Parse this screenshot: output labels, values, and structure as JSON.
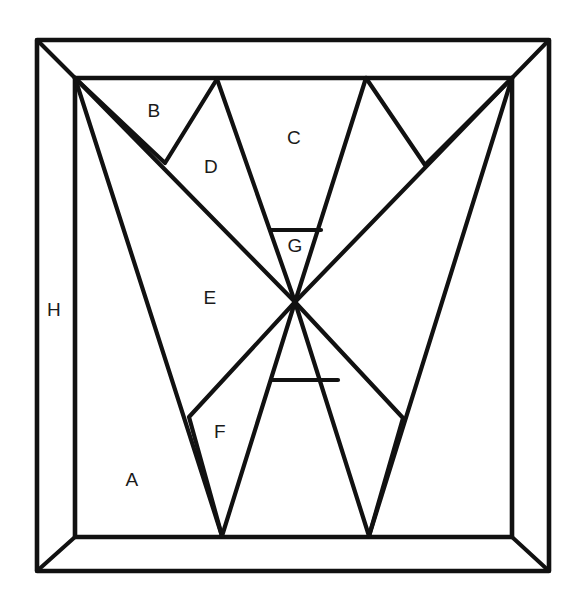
{
  "figure": {
    "name": "quilt-block-geometry-diagram",
    "type": "line-diagram",
    "background_color": "#ffffff",
    "line_color": "#111111",
    "canvas": {
      "width": 580,
      "height": 613
    }
  },
  "frame": {
    "outer": {
      "x1": 37,
      "y1": 40,
      "x2": 549,
      "y2": 571
    },
    "inner": {
      "x1": 75,
      "y1": 78,
      "x2": 512,
      "y2": 537
    },
    "bevel_corners": [
      "top-left",
      "top-right",
      "bottom-right",
      "bottom-left"
    ]
  },
  "center_point": {
    "x": 295,
    "y": 302
  },
  "vertices": {
    "top_left_inner": {
      "x": 75,
      "y": 78
    },
    "top_right_inner": {
      "x": 512,
      "y": 78
    },
    "bottom_left_inner": {
      "x": 75,
      "y": 537
    },
    "bottom_right_inner": {
      "x": 512,
      "y": 537
    },
    "top_peak_left": {
      "x": 217,
      "y": 79
    },
    "top_peak_right": {
      "x": 366,
      "y": 78
    },
    "valley_left": {
      "x": 165,
      "y": 163
    },
    "valley_right": {
      "x": 425,
      "y": 165
    },
    "bottom_peak_left": {
      "x": 222,
      "y": 536
    },
    "bottom_peak_right": {
      "x": 369,
      "y": 536
    },
    "notch_left": {
      "x": 189,
      "y": 417
    },
    "notch_right": {
      "x": 403,
      "y": 418
    },
    "band_upper": {
      "y": 230,
      "x_left": 271,
      "x_right": 321
    },
    "band_lower": {
      "y": 380,
      "x_left": 272,
      "x_right": 338
    }
  },
  "labels": [
    {
      "id": "A",
      "text": "A",
      "x": 132,
      "y": 481
    },
    {
      "id": "B",
      "text": "B",
      "x": 154,
      "y": 112
    },
    {
      "id": "C",
      "text": "C",
      "x": 294,
      "y": 139
    },
    {
      "id": "D",
      "text": "D",
      "x": 211,
      "y": 168
    },
    {
      "id": "E",
      "text": "E",
      "x": 210,
      "y": 299
    },
    {
      "id": "F",
      "text": "F",
      "x": 220,
      "y": 433
    },
    {
      "id": "G",
      "text": "G",
      "x": 295,
      "y": 247
    },
    {
      "id": "H",
      "text": "H",
      "x": 54,
      "y": 311
    }
  ],
  "region_count": 8,
  "label_set": "A B C D E F G H"
}
